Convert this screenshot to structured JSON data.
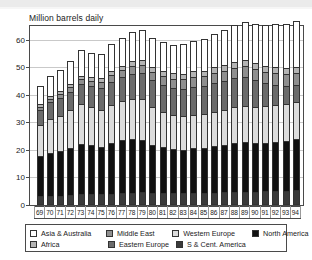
{
  "chart_data": {
    "type": "bar",
    "subtype": "stacked-bar",
    "title": "Million barrels daily",
    "xlabel": "",
    "ylabel": "",
    "ylim": [
      0,
      65
    ],
    "yticks": [
      0,
      10,
      20,
      30,
      40,
      50,
      60
    ],
    "ytick_labels": [
      "0",
      "10",
      "20",
      "30",
      "40",
      "50",
      "60"
    ],
    "grid": true,
    "legend_position": "bottom",
    "categories": [
      "69",
      "70",
      "71",
      "72",
      "73",
      "74",
      "75",
      "76",
      "77",
      "78",
      "79",
      "80",
      "81",
      "82",
      "83",
      "84",
      "85",
      "86",
      "87",
      "88",
      "89",
      "90",
      "91",
      "92",
      "93",
      "94"
    ],
    "series": [
      {
        "name": "S & Cent. America",
        "color": "#3a3a3a",
        "values": [
          2.4,
          2.6,
          2.7,
          2.9,
          3.1,
          3.2,
          3.2,
          3.4,
          3.6,
          3.8,
          3.9,
          3.8,
          3.7,
          3.7,
          3.6,
          3.7,
          3.7,
          3.8,
          3.9,
          4.0,
          4.1,
          4.1,
          4.2,
          4.3,
          4.4,
          4.6
        ]
      },
      {
        "name": "North America",
        "color": "#111111",
        "values": [
          14.6,
          15.6,
          16.1,
          17.2,
          18.3,
          17.8,
          17.3,
          18.4,
          19.2,
          19.5,
          19.0,
          17.4,
          16.6,
          15.9,
          15.8,
          16.3,
          16.3,
          16.8,
          17.1,
          17.7,
          17.9,
          17.6,
          17.5,
          17.8,
          18.1,
          18.5
        ]
      },
      {
        "name": "Western Europe",
        "color": "#dcdcdc",
        "values": [
          11.2,
          12.4,
          12.8,
          13.5,
          14.6,
          13.8,
          13.2,
          13.9,
          14.1,
          14.5,
          14.7,
          13.7,
          12.8,
          12.3,
          12.1,
          12.1,
          12.2,
          12.6,
          12.8,
          13.0,
          13.2,
          13.3,
          13.5,
          13.6,
          13.5,
          13.6
        ]
      },
      {
        "name": "Eastern Europe",
        "color": "#6b6b6b",
        "values": [
          5.6,
          6.0,
          6.4,
          6.8,
          7.2,
          7.6,
          8.0,
          8.4,
          8.8,
          9.2,
          9.5,
          9.7,
          9.8,
          9.9,
          10.0,
          10.1,
          10.2,
          10.4,
          10.5,
          10.6,
          10.4,
          9.5,
          8.3,
          7.3,
          6.6,
          6.0
        ]
      },
      {
        "name": "Middle East",
        "color": "#8f8f8f",
        "values": [
          1.2,
          1.3,
          1.5,
          1.6,
          1.8,
          1.9,
          2.1,
          2.3,
          2.5,
          2.7,
          2.9,
          3.0,
          3.2,
          3.3,
          3.4,
          3.5,
          3.6,
          3.7,
          3.8,
          3.9,
          4.0,
          4.1,
          4.0,
          4.2,
          4.3,
          4.4
        ]
      },
      {
        "name": "Africa",
        "color": "#b4b4b4",
        "values": [
          0.9,
          1.0,
          1.1,
          1.2,
          1.3,
          1.4,
          1.5,
          1.6,
          1.7,
          1.8,
          1.9,
          1.9,
          2.0,
          2.0,
          2.1,
          2.1,
          2.1,
          2.2,
          2.2,
          2.2,
          2.2,
          2.2,
          2.2,
          2.2,
          2.2,
          2.2
        ]
      },
      {
        "name": "Asia & Australia",
        "color": "#ffffff",
        "values": [
          6.6,
          7.1,
          7.6,
          8.4,
          9.2,
          8.9,
          9.0,
          9.6,
          10.1,
          10.6,
          11.0,
          10.6,
          10.4,
          10.4,
          10.7,
          11.2,
          11.5,
          12.0,
          12.5,
          13.2,
          13.8,
          14.3,
          14.9,
          15.5,
          16.0,
          16.7
        ]
      }
    ],
    "totals": [
      42.5,
      46.0,
      48.2,
      51.6,
      55.5,
      54.6,
      54.3,
      57.6,
      60.0,
      62.1,
      62.9,
      60.1,
      58.5,
      57.5,
      57.7,
      59.0,
      59.6,
      61.5,
      62.8,
      64.6,
      65.6,
      65.1,
      64.6,
      64.9,
      65.1,
      66.0
    ]
  },
  "legend": {
    "row1": [
      {
        "label": "Asia & Australia",
        "swatch": "#ffffff"
      },
      {
        "label": "Middle East",
        "swatch": "#8f8f8f"
      },
      {
        "label": "Western Europe",
        "swatch": "#dcdcdc"
      },
      {
        "label": "North America",
        "swatch": "#111111"
      }
    ],
    "row2": [
      {
        "label": "Africa",
        "swatch": "#b4b4b4"
      },
      {
        "label": "Eastern Europe",
        "swatch": "#6b6b6b"
      },
      {
        "label": "S & Cent. America",
        "swatch": "#3a3a3a"
      }
    ]
  }
}
